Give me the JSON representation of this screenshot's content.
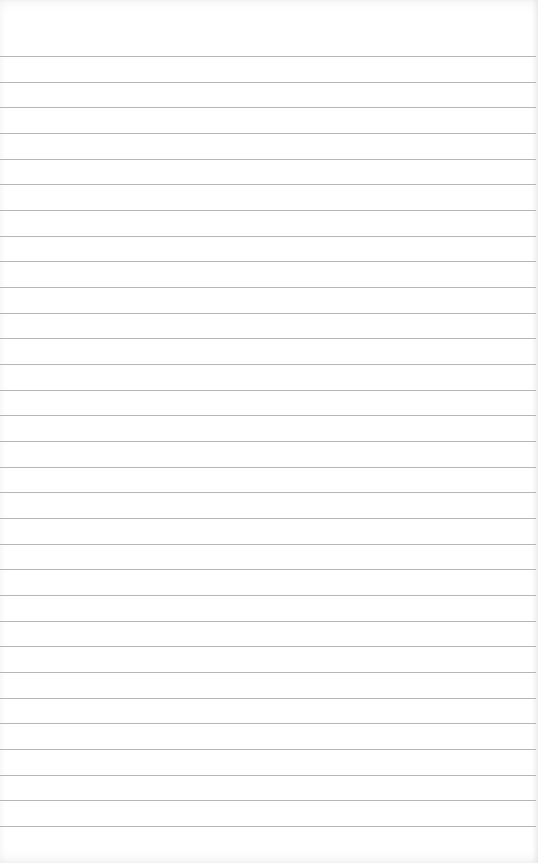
{
  "page": {
    "line_count": 31,
    "line_color": "#a9a9a9",
    "paper_color": "#ffffff",
    "text": ""
  }
}
